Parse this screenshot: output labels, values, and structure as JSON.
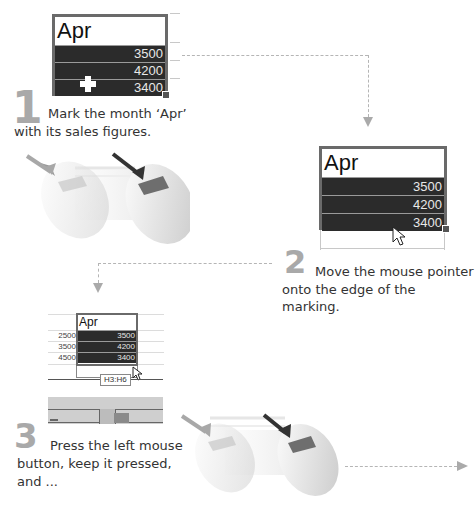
{
  "step1": {
    "number": "1",
    "text_line1": "Mark the month ‘Apr’",
    "text_line2": "with its sales figures.",
    "sheet": {
      "header": "Apr",
      "values": [
        "3500",
        "4200",
        "3400"
      ],
      "cursor": "plus-cursor"
    }
  },
  "step2": {
    "number": "2",
    "text_line1": "Move the mouse pointer",
    "text_line2": "onto the edge of the marking.",
    "sheet": {
      "header": "Apr",
      "values": [
        "3500",
        "4200",
        "3400"
      ],
      "cursor": "arrow-cursor"
    }
  },
  "step3": {
    "number": "3",
    "text_line1": "Press the left mouse",
    "text_line2": "button, keep it pressed,",
    "text_line3": "and ...",
    "sheet": {
      "header": "Apr",
      "row_labels": [
        "2500",
        "3500",
        "4500"
      ],
      "values": [
        "3500",
        "4200",
        "3400"
      ],
      "tooltip": "H3:H6",
      "cursor": "arrow-cursor"
    }
  },
  "colors": {
    "selection_fill": "#2b2b2b",
    "selection_border": "#6a6a6a",
    "step_number": "#a9a9a9",
    "dashed_arrow": "#b5b5b5",
    "mouse_button_pressed": "#6e6e6e"
  }
}
